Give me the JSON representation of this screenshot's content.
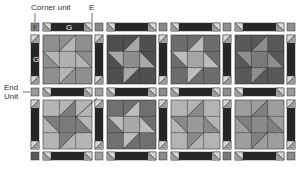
{
  "labels": {
    "corner_unit": "Corner unit",
    "e": "E",
    "f": "F",
    "g_top": "G",
    "g_side": "G",
    "end_unit_line1": "End",
    "end_unit_line2": "Unit"
  },
  "colors": {
    "background": "#ffffff",
    "sashing_dark": "#262626",
    "corner_light": "#d8d8d8",
    "outline": "#333333"
  },
  "grid": {
    "col_strip_x": [
      31,
      95,
      159,
      223,
      287
    ],
    "row_strip_y": [
      23,
      88,
      152
    ],
    "block_x": [
      43,
      107,
      171,
      235
    ],
    "block_y": [
      35,
      100
    ],
    "block_size": 49,
    "strip_size": 8
  },
  "corner_squares": [
    [
      "#888888",
      "#8a8a8a",
      "#8a8a8a",
      "#8e8e8e",
      "#909090"
    ],
    [
      "#9a9a9a",
      "#a0a0a0",
      "#8a8a8a",
      "#8c8c8c",
      "#9a9a9a"
    ],
    [
      "#5a5a5a",
      "#9e9e9e",
      "#8a8a8a",
      "#7a7a7a",
      "#8a8a8a"
    ]
  ],
  "blocks": [
    {
      "bg": "#8f8f8f",
      "star": "#b5b5b5",
      "center": "#b0b0b0"
    },
    {
      "bg": "#4f4f4f",
      "star": "#a8a8a8",
      "center": "#8d8d8d"
    },
    {
      "bg": "#6d6d6d",
      "star": "#bdbdbd",
      "center": "#a5a5a5"
    },
    {
      "bg": "#595959",
      "star": "#8e8e8e",
      "center": "#7a7a7a"
    },
    {
      "bg": "#b5b5b5",
      "star": "#7d7d7d",
      "center": "#7a7a7a"
    },
    {
      "bg": "#707070",
      "star": "#bcbcbc",
      "center": "#a8a8a8"
    },
    {
      "bg": "#b4b4b4",
      "star": "#8a8a8a",
      "center": "#9a9a9a"
    },
    {
      "bg": "#9e9e9e",
      "star": "#808080",
      "center": "#8a8a8a"
    }
  ]
}
